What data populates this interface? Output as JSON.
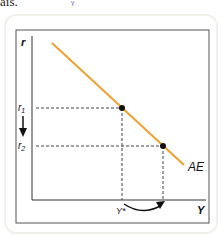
{
  "page": {
    "top_text": "ais.",
    "handwritten_mark": "ᵞ"
  },
  "diagram": {
    "y_axis_label": "r",
    "x_axis_label": "Y",
    "curve_label": "AE",
    "r1_label": "r",
    "r1_sub": "1",
    "r2_label": "r",
    "r2_sub": "2",
    "ystar_label": "Y*",
    "colors": {
      "curve": "#f0a030",
      "axes": "#333333",
      "frame": "#444444",
      "points": "#111111"
    }
  }
}
